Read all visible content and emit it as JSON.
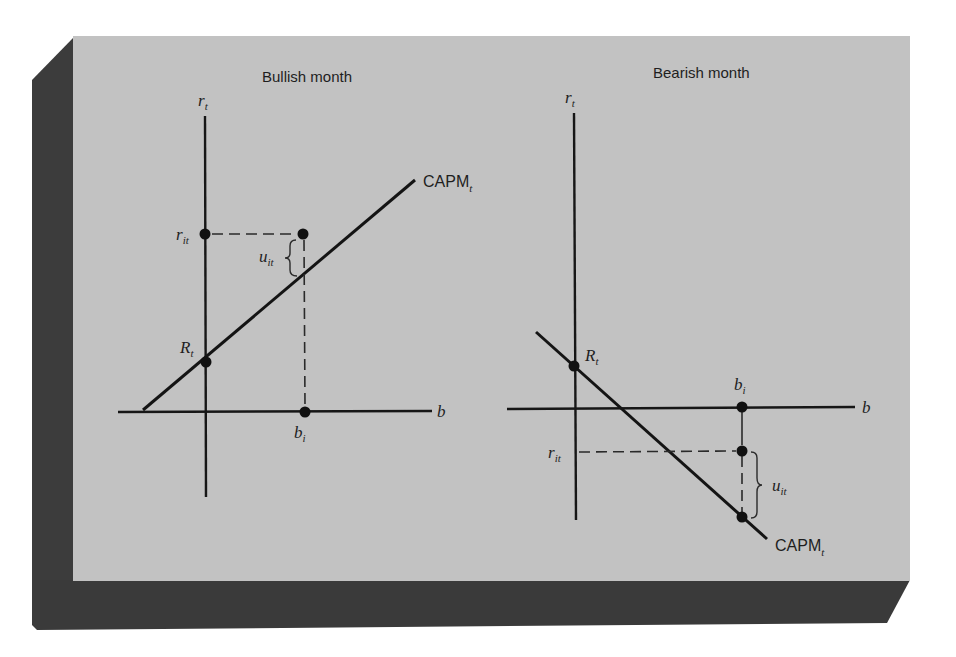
{
  "figure": {
    "colors": {
      "panel_background": "#c2c2c2",
      "frame_shadow": "#3c3c3c",
      "ink": "#151515",
      "page": "#ffffff"
    },
    "panels": [
      {
        "id": "bullish",
        "title": "Bullish month",
        "y_axis_label": "r",
        "y_axis_label_sub": "t",
        "x_axis_label": "b",
        "line_label": "CAPM",
        "line_label_sub": "t",
        "points": [
          {
            "label": "r",
            "sub": "it",
            "role": "observed return on y-axis"
          },
          {
            "label": "R",
            "sub": "t",
            "role": "CAPM intercept"
          },
          {
            "label": "b",
            "sub": "i",
            "role": "beta on x-axis"
          }
        ],
        "residual_label": "u",
        "residual_label_sub": "it",
        "line_slope": "positive"
      },
      {
        "id": "bearish",
        "title": "Bearish month",
        "y_axis_label": "r",
        "y_axis_label_sub": "t",
        "x_axis_label": "b",
        "line_label": "CAPM",
        "line_label_sub": "t",
        "points": [
          {
            "label": "R",
            "sub": "t",
            "role": "CAPM intercept"
          },
          {
            "label": "b",
            "sub": "i",
            "role": "beta on x-axis"
          },
          {
            "label": "r",
            "sub": "it",
            "role": "observed return on y-axis"
          }
        ],
        "residual_label": "u",
        "residual_label_sub": "it",
        "line_slope": "negative"
      }
    ]
  }
}
